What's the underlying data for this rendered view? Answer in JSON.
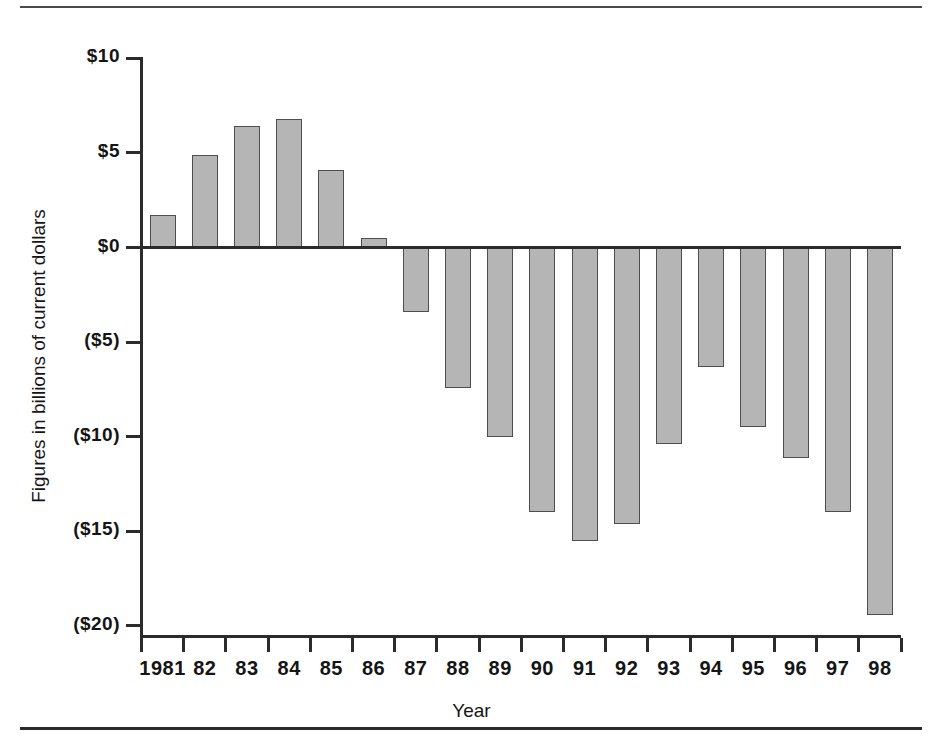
{
  "chart_data": {
    "type": "bar",
    "title": "",
    "xlabel": "Year",
    "ylabel": "Figures in billions of current dollars",
    "categories": [
      "1981",
      "82",
      "83",
      "84",
      "85",
      "86",
      "87",
      "88",
      "89",
      "90",
      "91",
      "92",
      "93",
      "94",
      "95",
      "96",
      "97",
      "98"
    ],
    "values": [
      1.7,
      4.9,
      6.4,
      6.8,
      4.1,
      0.5,
      -3.4,
      -7.4,
      -10.0,
      -14.0,
      -15.5,
      -14.6,
      -10.4,
      -6.3,
      -9.5,
      -11.1,
      -14.0,
      -19.4
    ],
    "ylim": [
      -20,
      10
    ],
    "ytick_values": [
      10,
      5,
      0,
      -5,
      -10,
      -15,
      -20
    ],
    "ytick_labels": [
      "$10",
      "$5",
      "$0",
      "($5)",
      "($10)",
      "($15)",
      "($20)"
    ],
    "grid": false,
    "legend": "none",
    "bar_fill_color": "#b5b5b5",
    "bar_edge_color": "#4e4e4e",
    "axis_color": "#2b2b2b"
  }
}
